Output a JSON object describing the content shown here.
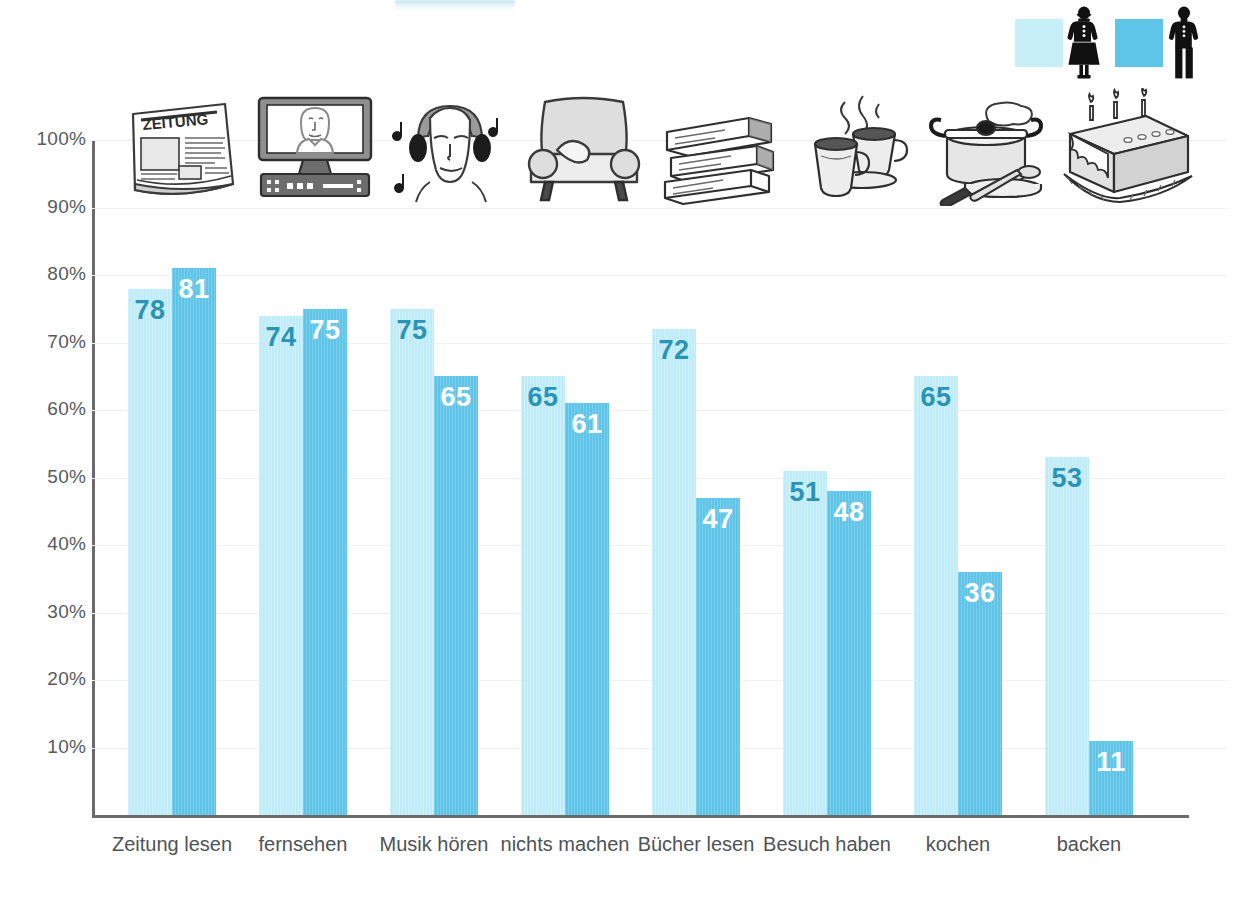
{
  "chart_data": {
    "type": "bar",
    "title": "",
    "xlabel": "",
    "ylabel": "",
    "ylim": [
      0,
      100
    ],
    "grid": true,
    "legend_position": "top-right",
    "categories": [
      "Zeitung lesen",
      "fernsehen",
      "Musik hören",
      "nichts machen",
      "Bücher lesen",
      "Besuch haben",
      "kochen",
      "backen"
    ],
    "ytick_labels": [
      "100%",
      "90%",
      "80%",
      "70%",
      "60%",
      "50%",
      "40%",
      "30%",
      "20%",
      "10%"
    ],
    "ytick_values": [
      100,
      90,
      80,
      70,
      60,
      50,
      40,
      30,
      20,
      10
    ],
    "series": [
      {
        "name": "Frauen",
        "icon": "female-pictogram",
        "color": "#bdecf8",
        "label_color": "#2b93b6",
        "values": [
          78,
          74,
          75,
          65,
          72,
          51,
          65,
          53
        ]
      },
      {
        "name": "Männer",
        "icon": "male-pictogram",
        "color": "#5fc5e8",
        "label_color": "#ffffff",
        "values": [
          81,
          75,
          65,
          61,
          47,
          48,
          36,
          11
        ]
      }
    ],
    "category_icons": [
      "newspaper-icon",
      "television-icon",
      "headphones-listener-icon",
      "armchair-icon",
      "book-stack-icon",
      "coffee-cups-icon",
      "cooking-pot-icon",
      "cake-icon"
    ],
    "newspaper_masthead_text": "ZEITUNG"
  },
  "colors": {
    "female_bar": "#bdecf8",
    "male_bar": "#5fc5e8",
    "female_label": "#2b93b6",
    "male_label": "#ffffff",
    "axis": "#6b6b6b",
    "grid": "#eef1f2",
    "text": "#4e5356",
    "background": "#ffffff"
  }
}
